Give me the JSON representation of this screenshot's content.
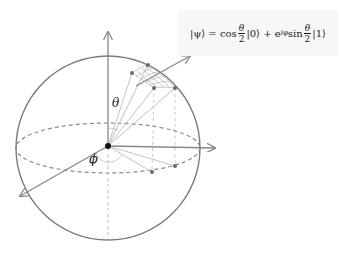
{
  "diagram": {
    "formula": {
      "ket_psi": "|ψ⟩ = cos",
      "theta": "θ",
      "two": "2",
      "ket0": "|0⟩ + e",
      "exp": "iφ",
      "sin": " sin",
      "ket1": "|1⟩"
    },
    "labels": {
      "theta": "θ",
      "phi": "ϕ"
    },
    "colors": {
      "sphere_outline": "#7a7a7a",
      "axis": "#8a8a8a",
      "dashed": "#8a8a8a",
      "point": "#6a6a6a",
      "center": "#111111",
      "formula_bg": "#f7f7f7"
    }
  }
}
